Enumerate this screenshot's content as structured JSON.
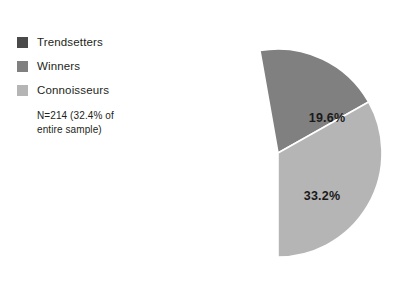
{
  "chart_data": {
    "type": "pie",
    "title": "",
    "categories": [
      "Trendsetters",
      "Winners",
      "Connoisseurs"
    ],
    "values": [
      47.2,
      33.2,
      19.6
    ],
    "value_labels": [
      "47.2%",
      "19.6%",
      "33.2%"
    ],
    "legend_position": "left",
    "grid": false,
    "note": "N=214 (32.4% of entire sample)",
    "slices": [
      {
        "name": "Trendsetters",
        "value": 47.2,
        "label": "47.2%",
        "color": "#4a4a4a",
        "label_color": "#ffffff",
        "start_angle": -10,
        "end_angle": -180
      },
      {
        "name": "Winners",
        "value": 19.6,
        "label": "19.6%",
        "color": "#808080",
        "label_color": "#1a1a1a",
        "start_angle": -10,
        "end_angle": 60.6
      },
      {
        "name": "Connoisseurs",
        "value": 33.2,
        "label": "33.2%",
        "color": "#b5b5b5",
        "label_color": "#1a1a1a",
        "start_angle": 60.6,
        "end_angle": 180
      }
    ]
  },
  "legend": {
    "items": [
      {
        "label": "Trendsetters",
        "color": "#4a4a4a"
      },
      {
        "label": "Winners",
        "color": "#808080"
      },
      {
        "label": "Connoisseurs",
        "color": "#b5b5b5"
      }
    ],
    "note_line_1": "N=214 (32.4% of",
    "note_line_2": "entire sample)"
  },
  "labels": {
    "trendsetters_pct": "47.2%",
    "winners_pct": "19.6%",
    "connoisseurs_pct": "33.2%"
  },
  "colors": {
    "background": "#ffffff",
    "dark_gray": "#4a4a4a",
    "medium_gray": "#808080",
    "light_gray": "#b5b5b5",
    "separator": "#ffffff",
    "text": "#231f20"
  }
}
